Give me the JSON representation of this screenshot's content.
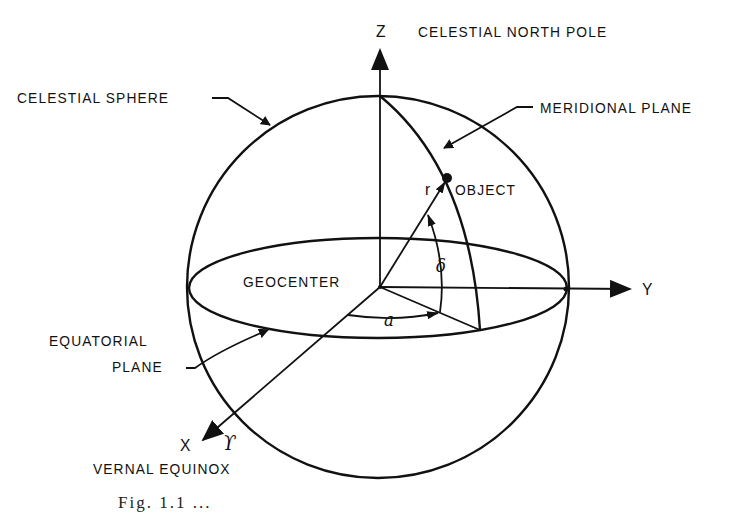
{
  "figure": {
    "caption_partial": "Fig. 1.1 ..."
  },
  "labels": {
    "z_axis": "Z",
    "celestial_north_pole": "CELESTIAL NORTH POLE",
    "celestial_sphere": "CELESTIAL SPHERE",
    "meridional_plane": "MERIDIONAL PLANE",
    "object": "OBJECT",
    "r": "r",
    "geocenter": "GEOCENTER",
    "y_axis": "Y",
    "delta": "δ",
    "alpha": "a",
    "equatorial_line1": "EQUATORIAL",
    "equatorial_line2": "PLANE",
    "x_axis": "X",
    "aries": "ϒ",
    "vernal_equinox": "VERNAL EQUINOX"
  },
  "colors": {
    "ink": "#111111",
    "background": "#ffffff"
  }
}
